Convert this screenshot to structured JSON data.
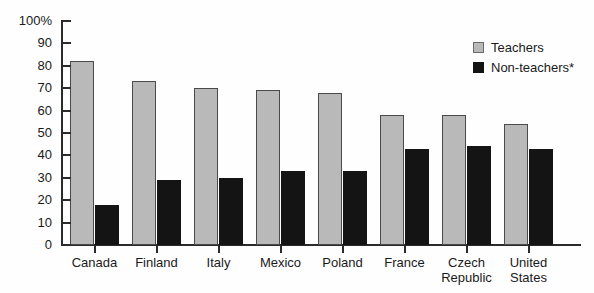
{
  "chart_data": {
    "type": "bar",
    "title": "",
    "subtitle": "",
    "xlabel": "",
    "ylabel": "",
    "ylim": [
      0,
      100
    ],
    "yticks": [
      "0",
      "10",
      "20",
      "30",
      "40",
      "50",
      "60",
      "70",
      "80",
      "90",
      "100%"
    ],
    "grid": false,
    "legend_position": "top-right",
    "categories": [
      "Canada",
      "Finland",
      "Italy",
      "Mexico",
      "Poland",
      "France",
      "Czech\nRepublic",
      "United\nStates"
    ],
    "series": [
      {
        "name": "Teachers",
        "color": "#b9b9b9",
        "values": [
          82,
          73,
          70,
          69,
          68,
          58,
          58,
          54
        ]
      },
      {
        "name": "Non-teachers*",
        "color": "#141414",
        "values": [
          18,
          29,
          30,
          33,
          33,
          43,
          44,
          43
        ]
      }
    ]
  },
  "legend": {
    "items": [
      {
        "label": "Teachers",
        "swatch": "teachers"
      },
      {
        "label": "Non-teachers*",
        "swatch": "nonteachers"
      }
    ]
  }
}
